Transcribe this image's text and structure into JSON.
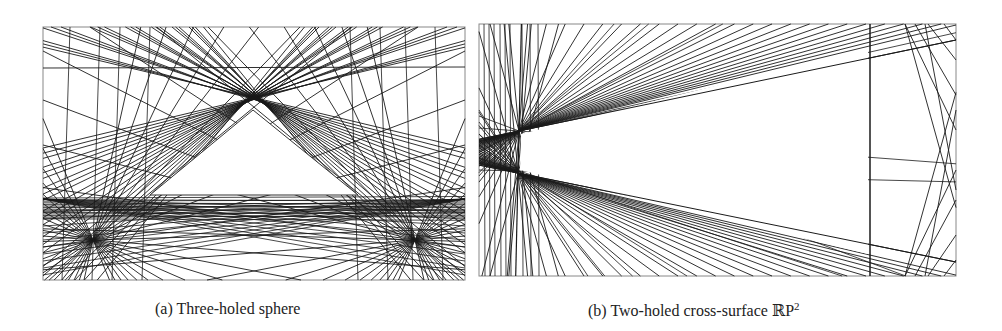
{
  "figure": {
    "panels": [
      {
        "id": "a",
        "label": "(a)",
        "caption": "Three-holed sphere",
        "frame": {
          "x": 43,
          "y": 27,
          "width": 422,
          "height": 253
        }
      },
      {
        "id": "b",
        "label": "(b)",
        "caption": "Two-holed cross-surface ",
        "caption_math": "ℝP",
        "caption_sup": "2",
        "frame": {
          "x": 479,
          "y": 24,
          "width": 477,
          "height": 252
        }
      }
    ],
    "line_color": "#1a1a1a",
    "frame_color": "#888888"
  }
}
